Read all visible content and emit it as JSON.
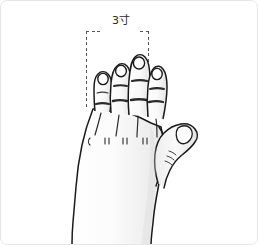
{
  "figure": {
    "measurement": {
      "label": "3寸",
      "value": 3,
      "unit": "寸",
      "unit_romanized": "cun",
      "bracket_style": "dashed",
      "spans": "four fingers (index through little finger) width"
    },
    "colors": {
      "outline": "#1a1a1a",
      "skin_light": "#fafafa",
      "skin_shade": "#e9e9e9",
      "nail": "#ffffff",
      "dash": "#555555",
      "frame_border": "#e6e6e6",
      "background": "#ffffff",
      "label_text": "#2b2b2b"
    },
    "parts": {
      "thumb": "thumb",
      "index_finger": "index-finger",
      "middle_finger": "middle-finger",
      "ring_finger": "ring-finger",
      "little_finger": "little-finger",
      "dorsum": "back-of-hand",
      "wrist": "wrist"
    }
  }
}
